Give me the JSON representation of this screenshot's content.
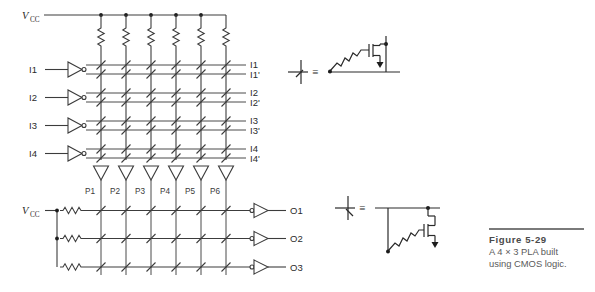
{
  "figure": {
    "caption_title": "Figure 5-29",
    "caption_line1": "A 4 × 3 PLA built",
    "caption_line2": "using CMOS logic."
  },
  "and_array": {
    "supply_label": "V",
    "supply_sub": "CC",
    "inputs": [
      {
        "name": "I1"
      },
      {
        "name": "I2"
      },
      {
        "name": "I3"
      },
      {
        "name": "I4"
      }
    ],
    "row_labels": [
      "I1",
      "I1'",
      "I2",
      "I2'",
      "I3",
      "I3'",
      "I4",
      "I4'"
    ],
    "pullup_count": 6,
    "pulldown_count": 6,
    "row_count": 8,
    "column_count": 6
  },
  "or_array": {
    "supply_label": "V",
    "supply_sub": "CC",
    "product_terms": [
      "P1",
      "P2",
      "P3",
      "P4",
      "P5",
      "P6"
    ],
    "outputs": [
      "O1",
      "O2",
      "O3"
    ],
    "pullup_count": 3
  },
  "legend": {
    "equals_symbol": "≡",
    "top_note": "nmos-transistor-equivalence",
    "bottom_note": "nmos-transistor-equivalence-inverted"
  },
  "colors": {
    "wire": "#3c3c3c",
    "text": "#2b2b2b",
    "caption_title": "#4a4a4a",
    "caption_body": "#5a5a5a",
    "rule": "#7a7a7a"
  }
}
